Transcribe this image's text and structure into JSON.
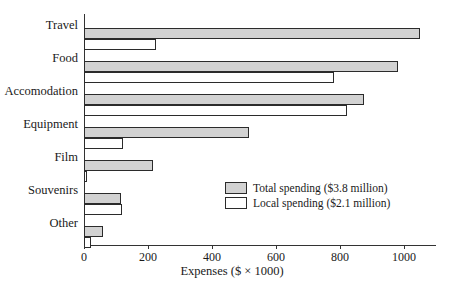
{
  "chart_data": {
    "type": "bar",
    "orientation": "horizontal",
    "title": "",
    "xlabel": "Expenses ($ × 1000)",
    "ylabel": "",
    "xlim": [
      0,
      1100
    ],
    "xticks": [
      0,
      200,
      400,
      600,
      800,
      1000
    ],
    "xtick_labels": [
      "0",
      "200",
      "400",
      "600",
      "800",
      "1000"
    ],
    "grid": false,
    "legend_position": "center-right",
    "categories": [
      "Travel",
      "Food",
      "Accomodation",
      "Equipment",
      "Film",
      "Souvenirs",
      "Other"
    ],
    "series": [
      {
        "name": "Total spending ($3.8 million)",
        "color": "#d2d2d2",
        "values": [
          1050,
          982,
          875,
          515,
          217,
          117,
          60
        ]
      },
      {
        "name": "Local spending ($2.1 million)",
        "color": "#ffffff",
        "values": [
          226,
          780,
          822,
          122,
          8,
          118,
          21
        ]
      }
    ]
  },
  "legend": {
    "items": [
      {
        "label": "Total spending ($3.8 million)",
        "swatch": "total"
      },
      {
        "label": "Local spending ($2.1 million)",
        "swatch": "local"
      }
    ]
  },
  "axis": {
    "x_title": "Expenses ($ × 1000)"
  },
  "colors": {
    "total_fill": "#d2d2d2",
    "local_fill": "#ffffff",
    "bar_border": "#2b2b2b",
    "axis": "#333333",
    "text": "#1a1a1a"
  }
}
